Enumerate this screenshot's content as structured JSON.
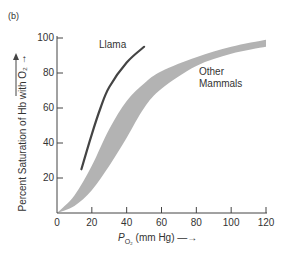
{
  "panel_label": "(b)",
  "chart_data": {
    "type": "line",
    "title": "",
    "xlabel": "PO2 (mm Hg)",
    "ylabel": "Percent Saturation of Hb with O2",
    "xlim": [
      0,
      120
    ],
    "ylim": [
      0,
      100
    ],
    "x_ticks": [
      0,
      20,
      40,
      60,
      80,
      100,
      120
    ],
    "y_ticks": [
      20,
      40,
      60,
      80,
      100
    ],
    "grid": false,
    "series": [
      {
        "name": "Llama",
        "style": "line",
        "color": "#444444",
        "x": [
          14,
          20,
          25,
          30,
          40,
          50
        ],
        "y": [
          25,
          45,
          60,
          72,
          86,
          95
        ]
      },
      {
        "name": "Other Mammals",
        "style": "band",
        "color": "#b3b3b3",
        "upper": {
          "x": [
            0,
            10,
            20,
            30,
            40,
            50,
            60,
            80,
            100,
            120
          ],
          "y": [
            0,
            10,
            27,
            48,
            64,
            74,
            81,
            89,
            95,
            99
          ]
        },
        "lower": {
          "x": [
            0,
            10,
            20,
            30,
            40,
            50,
            60,
            80,
            100,
            120
          ],
          "y": [
            0,
            4,
            13,
            27,
            43,
            60,
            71,
            84,
            91,
            95
          ]
        }
      }
    ],
    "annotations": [
      {
        "text": "Llama",
        "x": 33,
        "y": 96
      },
      {
        "text": "Other",
        "x": 80,
        "y": 81
      },
      {
        "text": "Mammals",
        "x": 80,
        "y": 74
      }
    ]
  },
  "labels": {
    "y_axis": "Percent Saturation of Hb with O₂ →",
    "x_axis_main": "P",
    "x_axis_sub": "O₂",
    "x_axis_rest": " (mm Hg) —→",
    "llama": "Llama",
    "other_line1": "Other",
    "other_line2": "Mammals"
  }
}
